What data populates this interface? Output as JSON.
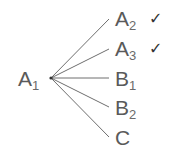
{
  "diagram": {
    "type": "tree",
    "root": {
      "label": "A",
      "subscript": "1",
      "x": 51,
      "y": 78
    },
    "branches": [
      {
        "label": "A",
        "subscript": "2",
        "y": 19,
        "checked": true
      },
      {
        "label": "A",
        "subscript": "3",
        "y": 49,
        "checked": true
      },
      {
        "label": "B",
        "subscript": "1",
        "y": 78,
        "checked": false
      },
      {
        "label": "B",
        "subscript": "2",
        "y": 107,
        "checked": false
      },
      {
        "label": "C",
        "subscript": "",
        "y": 137,
        "checked": false
      }
    ],
    "check_symbol": "✓",
    "line_color": "#6e6e6e",
    "text_color": "#5a5a5a"
  }
}
